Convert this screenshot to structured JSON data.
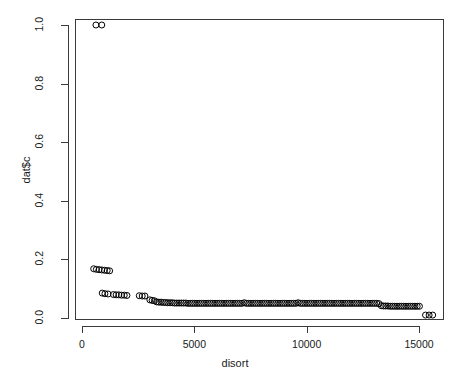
{
  "chart_data": {
    "type": "scatter",
    "title": "",
    "xlabel": "disort",
    "ylabel": "dat$c",
    "xlim": [
      -382,
      15880
    ],
    "ylim": [
      -0.034,
      1.034
    ],
    "xticks": [
      0,
      5000,
      10000,
      15000
    ],
    "xtick_labels": [
      "0",
      "5000",
      "10000",
      "15000"
    ],
    "yticks": [
      0.0,
      0.2,
      0.4,
      0.6,
      0.8,
      1.0
    ],
    "ytick_labels": [
      "0.0",
      "0.2",
      "0.4",
      "0.6",
      "0.8",
      "1.0"
    ],
    "grid": false,
    "legend": false,
    "point_style": {
      "marker": "open-circle",
      "radius_px": 3.0,
      "stroke": "#000000",
      "stroke_width_px": 1.0,
      "fill": "none"
    },
    "box_color": "#3a3a3a",
    "axis_color": "#3a3a3a",
    "background": "#ffffff",
    "series": [
      {
        "name": "dat$c",
        "points": [
          [
            620,
            1.0
          ],
          [
            880,
            1.0
          ],
          [
            520,
            0.168
          ],
          [
            640,
            0.166
          ],
          [
            760,
            0.165
          ],
          [
            880,
            0.164
          ],
          [
            1000,
            0.163
          ],
          [
            1120,
            0.162
          ],
          [
            1230,
            0.161
          ],
          [
            900,
            0.085
          ],
          [
            1020,
            0.083
          ],
          [
            1160,
            0.082
          ],
          [
            1400,
            0.08
          ],
          [
            1520,
            0.079
          ],
          [
            1640,
            0.079
          ],
          [
            1760,
            0.078
          ],
          [
            1880,
            0.078
          ],
          [
            2000,
            0.077
          ],
          [
            2550,
            0.076
          ],
          [
            2680,
            0.075
          ],
          [
            2800,
            0.075
          ],
          [
            3020,
            0.062
          ],
          [
            3120,
            0.06
          ],
          [
            3220,
            0.059
          ],
          [
            3320,
            0.055
          ],
          [
            3420,
            0.054
          ],
          [
            3520,
            0.054
          ],
          [
            3620,
            0.053
          ],
          [
            3720,
            0.053
          ],
          [
            3820,
            0.052
          ],
          [
            3920,
            0.052
          ],
          [
            4020,
            0.052
          ],
          [
            4120,
            0.051
          ],
          [
            4220,
            0.051
          ],
          [
            4320,
            0.051
          ],
          [
            4420,
            0.051
          ],
          [
            4520,
            0.051
          ],
          [
            4620,
            0.051
          ],
          [
            4720,
            0.05
          ],
          [
            4820,
            0.05
          ],
          [
            4920,
            0.05
          ],
          [
            5020,
            0.05
          ],
          [
            5120,
            0.05
          ],
          [
            5220,
            0.05
          ],
          [
            5320,
            0.05
          ],
          [
            5420,
            0.05
          ],
          [
            5520,
            0.05
          ],
          [
            5620,
            0.05
          ],
          [
            5720,
            0.05
          ],
          [
            5820,
            0.05
          ],
          [
            5920,
            0.05
          ],
          [
            6020,
            0.05
          ],
          [
            6120,
            0.05
          ],
          [
            6220,
            0.05
          ],
          [
            6320,
            0.05
          ],
          [
            6420,
            0.05
          ],
          [
            6520,
            0.05
          ],
          [
            6620,
            0.05
          ],
          [
            6720,
            0.05
          ],
          [
            6820,
            0.05
          ],
          [
            6920,
            0.05
          ],
          [
            7020,
            0.05
          ],
          [
            7120,
            0.05
          ],
          [
            7220,
            0.052
          ],
          [
            7320,
            0.05
          ],
          [
            7420,
            0.05
          ],
          [
            7520,
            0.05
          ],
          [
            7620,
            0.05
          ],
          [
            7720,
            0.05
          ],
          [
            7820,
            0.05
          ],
          [
            7920,
            0.05
          ],
          [
            8020,
            0.05
          ],
          [
            8120,
            0.05
          ],
          [
            8220,
            0.05
          ],
          [
            8320,
            0.05
          ],
          [
            8420,
            0.05
          ],
          [
            8520,
            0.05
          ],
          [
            8620,
            0.05
          ],
          [
            8720,
            0.05
          ],
          [
            8820,
            0.05
          ],
          [
            8920,
            0.05
          ],
          [
            9020,
            0.05
          ],
          [
            9120,
            0.05
          ],
          [
            9220,
            0.05
          ],
          [
            9320,
            0.05
          ],
          [
            9420,
            0.05
          ],
          [
            9520,
            0.05
          ],
          [
            9620,
            0.052
          ],
          [
            9720,
            0.05
          ],
          [
            9820,
            0.05
          ],
          [
            9920,
            0.05
          ],
          [
            10020,
            0.05
          ],
          [
            10120,
            0.05
          ],
          [
            10220,
            0.05
          ],
          [
            10320,
            0.05
          ],
          [
            10420,
            0.05
          ],
          [
            10520,
            0.05
          ],
          [
            10620,
            0.05
          ],
          [
            10720,
            0.05
          ],
          [
            10820,
            0.05
          ],
          [
            10920,
            0.05
          ],
          [
            11020,
            0.05
          ],
          [
            11120,
            0.05
          ],
          [
            11220,
            0.05
          ],
          [
            11320,
            0.05
          ],
          [
            11420,
            0.05
          ],
          [
            11520,
            0.05
          ],
          [
            11620,
            0.05
          ],
          [
            11720,
            0.05
          ],
          [
            11820,
            0.05
          ],
          [
            11920,
            0.05
          ],
          [
            12020,
            0.05
          ],
          [
            12120,
            0.05
          ],
          [
            12220,
            0.05
          ],
          [
            12320,
            0.05
          ],
          [
            12420,
            0.05
          ],
          [
            12520,
            0.05
          ],
          [
            12620,
            0.05
          ],
          [
            12720,
            0.05
          ],
          [
            12820,
            0.05
          ],
          [
            12920,
            0.05
          ],
          [
            13020,
            0.05
          ],
          [
            13120,
            0.05
          ],
          [
            13220,
            0.049
          ],
          [
            13320,
            0.042
          ],
          [
            13420,
            0.041
          ],
          [
            13520,
            0.041
          ],
          [
            13620,
            0.041
          ],
          [
            13720,
            0.04
          ],
          [
            13820,
            0.04
          ],
          [
            13920,
            0.04
          ],
          [
            14020,
            0.04
          ],
          [
            14120,
            0.04
          ],
          [
            14220,
            0.04
          ],
          [
            14320,
            0.04
          ],
          [
            14420,
            0.04
          ],
          [
            14520,
            0.04
          ],
          [
            14620,
            0.04
          ],
          [
            14720,
            0.04
          ],
          [
            14820,
            0.04
          ],
          [
            14920,
            0.04
          ],
          [
            15020,
            0.04
          ],
          [
            15290,
            0.01
          ],
          [
            15450,
            0.01
          ],
          [
            15610,
            0.01
          ]
        ]
      }
    ]
  }
}
